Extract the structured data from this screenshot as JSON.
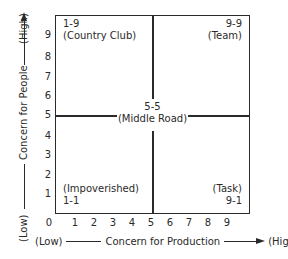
{
  "diagram": {
    "y_axis": {
      "title": "Concern for People",
      "low_label": "(Low)",
      "high_label": "(High)",
      "ticks": [
        "1",
        "2",
        "3",
        "4",
        "5",
        "6",
        "7",
        "8",
        "9"
      ]
    },
    "x_axis": {
      "title": "Concern for Production",
      "low_label": "(Low)",
      "high_label": "(High)",
      "ticks": [
        "0",
        "1",
        "2",
        "3",
        "4",
        "5",
        "6",
        "7",
        "8",
        "9"
      ]
    },
    "quadrants": {
      "top_left": {
        "code": "1-9",
        "name": "(Country Club)"
      },
      "top_right": {
        "code": "9-9",
        "name": "(Team)"
      },
      "center": {
        "code": "5-5",
        "name": "(Middle Road)"
      },
      "bottom_left": {
        "code": "1-1",
        "name": "(Impoverished)"
      },
      "bottom_right": {
        "code": "9-1",
        "name": "(Task)"
      }
    },
    "line_color": "#2a2a2a"
  }
}
